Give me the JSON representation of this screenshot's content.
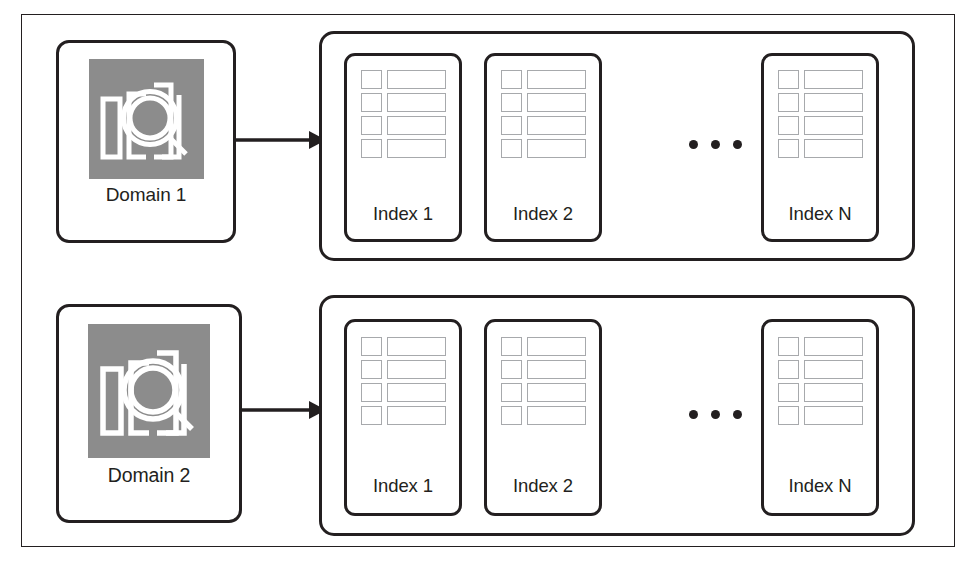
{
  "diagram": {
    "colors": {
      "stroke": "#231f20",
      "icon_background": "#8c8c8c",
      "icon_glyph": "#ffffff",
      "row_outline": "#a7a9ac",
      "page_background": "#ffffff"
    },
    "rows": [
      {
        "domain": {
          "label": "Domain 1",
          "icon": "bar-chart-magnifier-icon"
        },
        "arrow": {
          "name": "arrow-domain-to-indices",
          "direction": "right"
        },
        "indices": {
          "cards": [
            {
              "label": "Index 1",
              "row_count": 4
            },
            {
              "label": "Index 2",
              "row_count": 4
            },
            {
              "label": "Index N",
              "row_count": 4
            }
          ],
          "ellipsis": "• • •"
        }
      },
      {
        "domain": {
          "label": "Domain 2",
          "icon": "bar-chart-magnifier-icon"
        },
        "arrow": {
          "name": "arrow-domain-to-indices",
          "direction": "right"
        },
        "indices": {
          "cards": [
            {
              "label": "Index 1",
              "row_count": 4
            },
            {
              "label": "Index 2",
              "row_count": 4
            },
            {
              "label": "Index N",
              "row_count": 4
            }
          ],
          "ellipsis": "• • •"
        }
      }
    ]
  }
}
